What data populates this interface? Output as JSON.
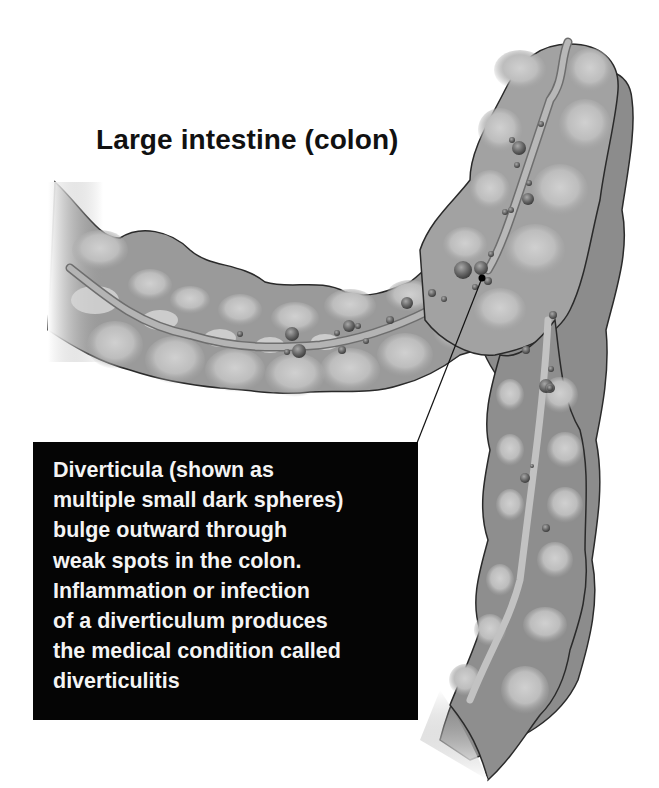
{
  "title": "Large intestine (colon)",
  "callout": {
    "lines": [
      "Diverticula (shown as",
      "multiple small dark spheres)",
      "bulge outward through",
      "weak spots in the colon.",
      "Inflammation or infection",
      "of a diverticulum produces",
      "the medical condition called",
      "diverticulitis"
    ]
  },
  "colors": {
    "background": "#ffffff",
    "colon_wall": "#9a9a9a",
    "colon_dark": "#6e6e6e",
    "haustra_highlight": "#c4c4c4",
    "diverticula": "#6a6a6a",
    "callout_background": "#050505",
    "callout_text": "#f4f4f4"
  }
}
